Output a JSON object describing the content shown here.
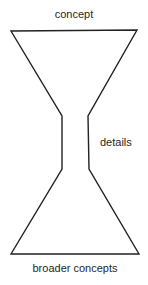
{
  "diagram": {
    "type": "hourglass",
    "stroke_color": "#222222",
    "background_color": "#ffffff",
    "labels": {
      "top": "concept",
      "middle": "details",
      "bottom": "broader concepts"
    },
    "shape_points": "11,31 137,30 88,116 89,169 139,254 11,254 62,169 62,116"
  }
}
